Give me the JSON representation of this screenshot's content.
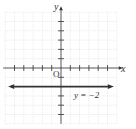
{
  "chart_data": {
    "type": "line",
    "title": "",
    "xlabel": "x",
    "ylabel": "y",
    "origin_label": "O",
    "xlim": [
      -6,
      6
    ],
    "ylim": [
      -6,
      6
    ],
    "grid": true,
    "x_ticks_visible": [
      -5,
      -4,
      -3,
      -2,
      -1,
      1,
      2,
      3,
      4,
      5
    ],
    "y_ticks_visible": [
      -5,
      -4,
      -3,
      -2,
      -1,
      1,
      2,
      3,
      4,
      5
    ],
    "series": [
      {
        "name": "y = -2",
        "equation": "y = -2",
        "kind": "horizontal line with arrows at both ends",
        "x": [
          -6,
          6
        ],
        "y": [
          -2,
          -2
        ]
      }
    ],
    "annotations": [
      {
        "text": "y = −2",
        "x": 3,
        "y": -3
      }
    ]
  },
  "colors": {
    "grid": "#dcdcdc",
    "axis": "#333333",
    "line": "#333333"
  }
}
